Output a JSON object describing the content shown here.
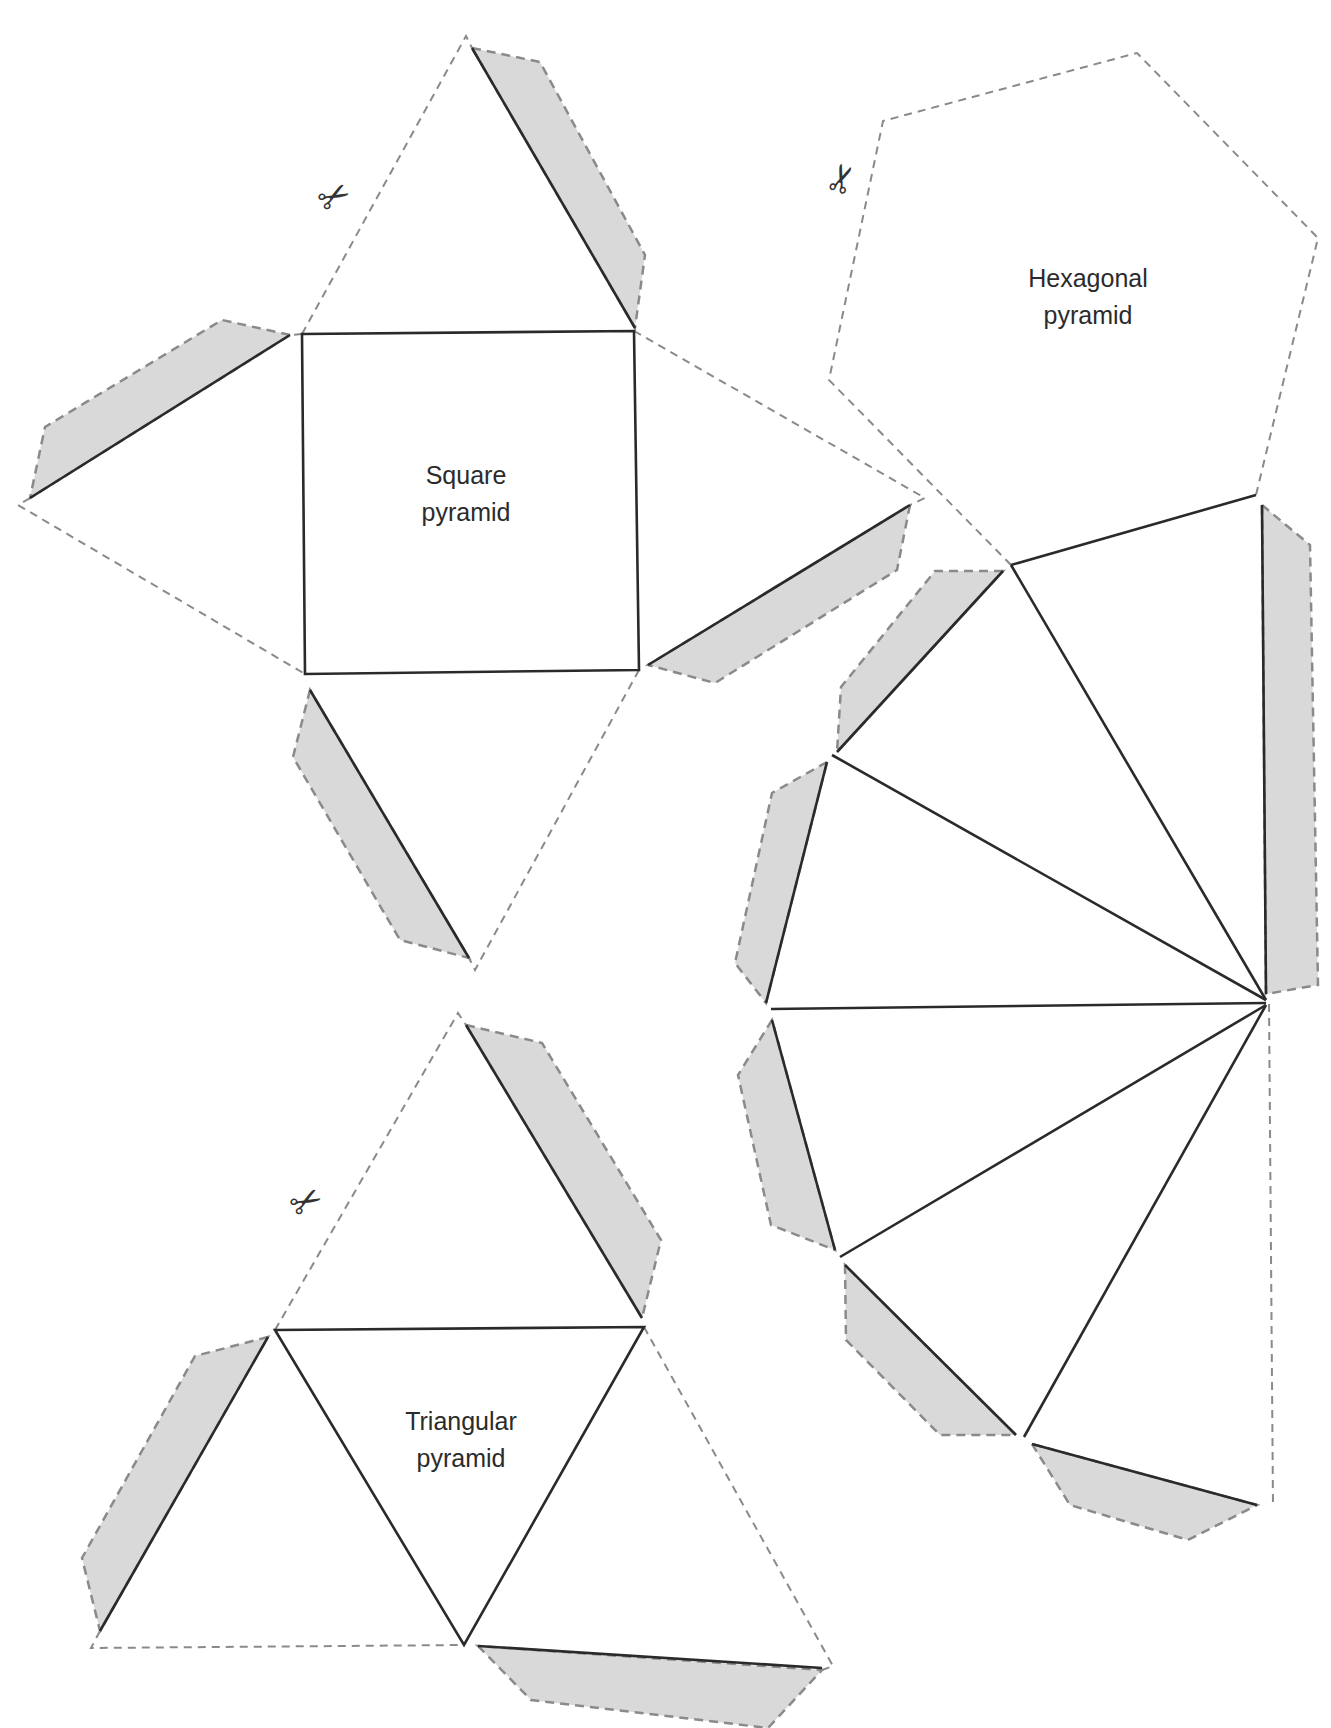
{
  "nets": [
    {
      "name": "square-pyramid",
      "label_line1": "Square",
      "label_line2": "pyramid",
      "faces": 5,
      "tabs": 4
    },
    {
      "name": "hexagonal-pyramid",
      "label_line1": "Hexagonal",
      "label_line2": "pyramid",
      "faces": 7,
      "tabs": 6
    },
    {
      "name": "triangular-pyramid",
      "label_line1": "Triangular",
      "label_line2": "pyramid",
      "faces": 4,
      "tabs": 3
    }
  ],
  "icons": {
    "cut_marker": "scissors-icon",
    "glyph": "✂"
  },
  "colors": {
    "tab_fill": "#d9d9d9",
    "cut_line": "#8a8a8a",
    "fold_line": "#2a2a2a",
    "text": "#2b2b2b"
  }
}
